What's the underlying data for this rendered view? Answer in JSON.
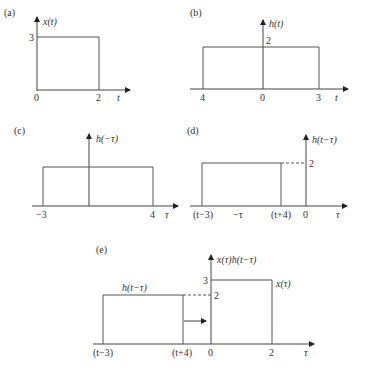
{
  "panels": {
    "a": {
      "tag": "(a)",
      "ylabel": "x(t)",
      "xlabel": "t",
      "ytick": "3",
      "xticks": [
        "0",
        "2"
      ]
    },
    "b": {
      "tag": "(b)",
      "ylabel": "h(t)",
      "xlabel": "t",
      "ytick": "2",
      "xticks": [
        "4",
        "0",
        "3"
      ]
    },
    "c": {
      "tag": "(c)",
      "ylabel": "h(−τ)",
      "xlabel": "τ",
      "xticks": [
        "−3",
        "4"
      ]
    },
    "d": {
      "tag": "(d)",
      "ylabel": "h(t−τ)",
      "xlabel": "τ",
      "ytick": "2",
      "xticks": [
        "(t−3)",
        "−τ",
        "(t+4)",
        "0"
      ]
    },
    "e": {
      "tag": "(e)",
      "ylabel": "x(τ)h(t−τ)",
      "xlabel": "τ",
      "yticks": [
        "3",
        "2"
      ],
      "xticks": [
        "(t−3)",
        "(t+4)",
        "0",
        "2"
      ],
      "curve_labels": [
        "h(t−τ)",
        "x(τ)"
      ]
    }
  }
}
